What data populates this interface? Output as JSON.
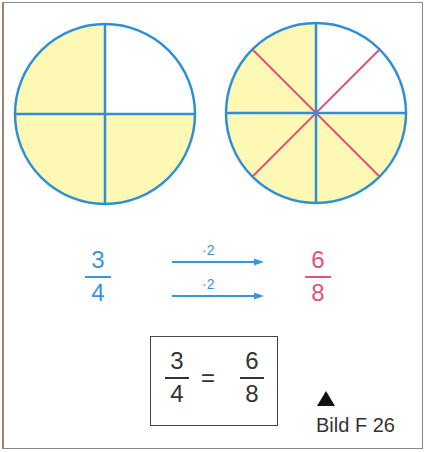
{
  "figure": {
    "caption": "Bild F 26",
    "marker_icon": "triangle-up-icon"
  },
  "colors": {
    "circle_stroke": "#2e8fd6",
    "shaded_fill": "#fdf9b4",
    "added_lines": "#e8456f",
    "blue_text": "#3a95d8",
    "pink_text": "#e8507a",
    "dark_text": "#333333"
  },
  "circles": [
    {
      "name": "quarters",
      "parts": 4,
      "shaded": 3,
      "division_lines": [
        "vertical",
        "horizontal"
      ]
    },
    {
      "name": "eighths",
      "parts": 8,
      "shaded": 6,
      "division_lines": [
        "vertical",
        "horizontal",
        "diagonal",
        "diagonal"
      ]
    }
  ],
  "left_fraction": {
    "numerator": "3",
    "denominator": "4"
  },
  "right_fraction": {
    "numerator": "6",
    "denominator": "8"
  },
  "operators": [
    {
      "label": "·2",
      "applies_to": "numerator"
    },
    {
      "label": "·2",
      "applies_to": "denominator"
    }
  ],
  "equation": {
    "left": {
      "numerator": "3",
      "denominator": "4"
    },
    "sign": "=",
    "right": {
      "numerator": "6",
      "denominator": "8"
    }
  }
}
